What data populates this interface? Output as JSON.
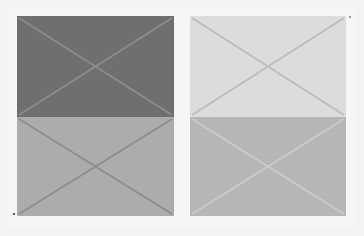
{
  "panels": [
    {
      "id": "top-left",
      "x": 17,
      "y": 16,
      "w": 157,
      "h": 101,
      "fill": "#6f6f6f",
      "line": "#8c8c8c"
    },
    {
      "id": "top-right",
      "x": 190,
      "y": 16,
      "w": 156,
      "h": 101,
      "fill": "#dcdcdc",
      "line": "#bdbdbd"
    },
    {
      "id": "bottom-left",
      "x": 17,
      "y": 117,
      "w": 157,
      "h": 99,
      "fill": "#acacac",
      "line": "#8e8e8e"
    },
    {
      "id": "bottom-right",
      "x": 190,
      "y": 117,
      "w": 156,
      "h": 99,
      "fill": "#b6b6b6",
      "line": "#cacaca"
    }
  ],
  "colors": {
    "background": "#f3f3f3"
  }
}
